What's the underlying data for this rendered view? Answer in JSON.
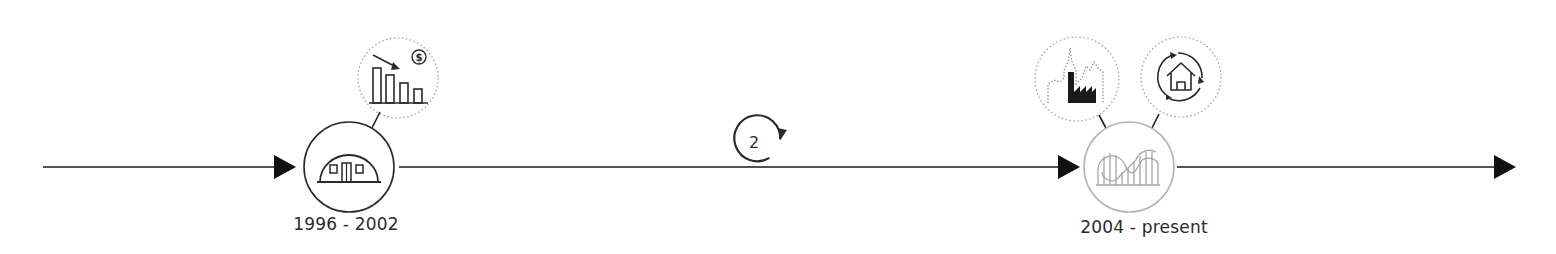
{
  "diagram": {
    "type": "timeline",
    "colors": {
      "line": "#1a1a1a",
      "active_circle": "#2a2a2a",
      "faded_circle": "#b5b5b5",
      "dotted": "#9a9a9a"
    },
    "cycle_marker": {
      "label": "2"
    },
    "stages": [
      {
        "label": "1996 - 2002",
        "main_icon": "quonset-hut-icon",
        "satellites": [
          {
            "icon": "declining-bar-chart-dollar-icon"
          }
        ]
      },
      {
        "label": "2004 - present",
        "main_icon": "roller-coaster-icon",
        "satellites": [
          {
            "icon": "city-skyline-factory-icon"
          },
          {
            "icon": "house-cycle-icon"
          }
        ]
      }
    ]
  }
}
